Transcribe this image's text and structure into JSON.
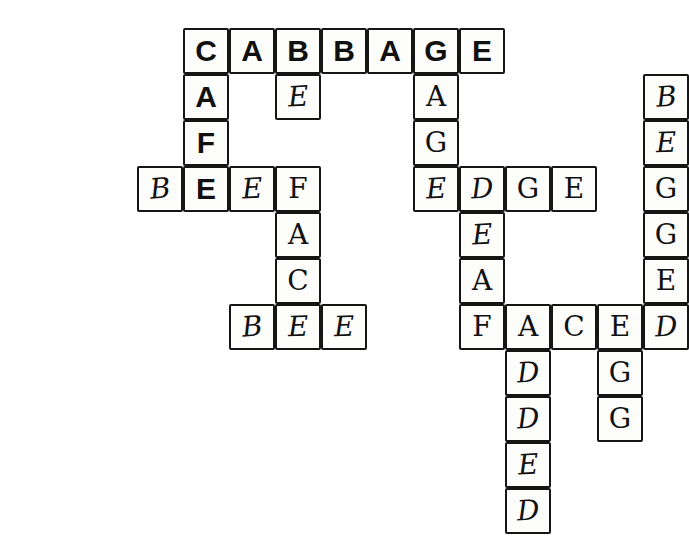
{
  "puzzle": {
    "title": "Hand-drawn crossword grid",
    "cell_size": 46,
    "origin_x": 91,
    "origin_y": 28,
    "ink_color": "#151515",
    "paper_color": "#ffffff",
    "cells": [
      {
        "r": 0,
        "c": 2,
        "letter": "C",
        "style": "printed",
        "rot": 0
      },
      {
        "r": 0,
        "c": 3,
        "letter": "A",
        "style": "printed",
        "rot": 0
      },
      {
        "r": 0,
        "c": 4,
        "letter": "B",
        "style": "printed",
        "rot": 0
      },
      {
        "r": 0,
        "c": 5,
        "letter": "B",
        "style": "printed",
        "rot": 0
      },
      {
        "r": 0,
        "c": 6,
        "letter": "A",
        "style": "printed",
        "rot": 0
      },
      {
        "r": 0,
        "c": 7,
        "letter": "G",
        "style": "printed",
        "rot": 0
      },
      {
        "r": 0,
        "c": 8,
        "letter": "E",
        "style": "printed",
        "rot": 0
      },
      {
        "r": 1,
        "c": 2,
        "letter": "A",
        "style": "printed",
        "rot": 0
      },
      {
        "r": 1,
        "c": 4,
        "letter": "E",
        "style": "hand",
        "rot": -3
      },
      {
        "r": 1,
        "c": 7,
        "letter": "A",
        "style": "hand-up",
        "rot": 0
      },
      {
        "r": 1,
        "c": 12,
        "letter": "B",
        "style": "hand",
        "rot": -4
      },
      {
        "r": 2,
        "c": 2,
        "letter": "F",
        "style": "printed",
        "rot": 0
      },
      {
        "r": 2,
        "c": 7,
        "letter": "G",
        "style": "hand-up",
        "rot": 0
      },
      {
        "r": 2,
        "c": 12,
        "letter": "E",
        "style": "hand",
        "rot": -2
      },
      {
        "r": 3,
        "c": 1,
        "letter": "B",
        "style": "hand",
        "rot": -5
      },
      {
        "r": 3,
        "c": 2,
        "letter": "E",
        "style": "printed",
        "rot": 0
      },
      {
        "r": 3,
        "c": 3,
        "letter": "E",
        "style": "hand",
        "rot": -3
      },
      {
        "r": 3,
        "c": 4,
        "letter": "F",
        "style": "hand-up",
        "rot": 0
      },
      {
        "r": 3,
        "c": 7,
        "letter": "E",
        "style": "hand",
        "rot": -3
      },
      {
        "r": 3,
        "c": 8,
        "letter": "D",
        "style": "hand",
        "rot": -3
      },
      {
        "r": 3,
        "c": 9,
        "letter": "G",
        "style": "hand-up",
        "rot": 0
      },
      {
        "r": 3,
        "c": 10,
        "letter": "E",
        "style": "hand-up",
        "rot": 0
      },
      {
        "r": 3,
        "c": 12,
        "letter": "G",
        "style": "hand-up",
        "rot": 0
      },
      {
        "r": 4,
        "c": 4,
        "letter": "A",
        "style": "hand-up",
        "rot": 0
      },
      {
        "r": 4,
        "c": 8,
        "letter": "E",
        "style": "hand",
        "rot": -3
      },
      {
        "r": 4,
        "c": 12,
        "letter": "G",
        "style": "hand-up",
        "rot": 0
      },
      {
        "r": 5,
        "c": 4,
        "letter": "C",
        "style": "hand-up",
        "rot": 0
      },
      {
        "r": 5,
        "c": 8,
        "letter": "A",
        "style": "hand-up",
        "rot": 0
      },
      {
        "r": 5,
        "c": 12,
        "letter": "E",
        "style": "hand-up",
        "rot": 0
      },
      {
        "r": 6,
        "c": 3,
        "letter": "B",
        "style": "hand",
        "rot": -5
      },
      {
        "r": 6,
        "c": 4,
        "letter": "E",
        "style": "hand",
        "rot": -2
      },
      {
        "r": 6,
        "c": 5,
        "letter": "E",
        "style": "hand",
        "rot": -2
      },
      {
        "r": 6,
        "c": 8,
        "letter": "F",
        "style": "hand-up",
        "rot": 0
      },
      {
        "r": 6,
        "c": 9,
        "letter": "A",
        "style": "hand-up",
        "rot": 0
      },
      {
        "r": 6,
        "c": 10,
        "letter": "C",
        "style": "hand-up",
        "rot": 0
      },
      {
        "r": 6,
        "c": 11,
        "letter": "E",
        "style": "hand-up",
        "rot": 0
      },
      {
        "r": 6,
        "c": 12,
        "letter": "D",
        "style": "hand",
        "rot": -3
      },
      {
        "r": 7,
        "c": 9,
        "letter": "D",
        "style": "hand",
        "rot": -3
      },
      {
        "r": 7,
        "c": 11,
        "letter": "G",
        "style": "hand-up",
        "rot": 0
      },
      {
        "r": 8,
        "c": 9,
        "letter": "D",
        "style": "hand",
        "rot": -3
      },
      {
        "r": 8,
        "c": 11,
        "letter": "G",
        "style": "hand-up",
        "rot": 0
      },
      {
        "r": 9,
        "c": 9,
        "letter": "E",
        "style": "hand",
        "rot": -3
      },
      {
        "r": 10,
        "c": 9,
        "letter": "D",
        "style": "hand",
        "rot": -3
      }
    ],
    "words": {
      "across": [
        {
          "text": "CABBAGE",
          "row": 0,
          "col": 2,
          "length": 7
        },
        {
          "text": "BEEF",
          "row": 3,
          "col": 1,
          "length": 4
        },
        {
          "text": "EDGE",
          "row": 3,
          "col": 7,
          "length": 4
        },
        {
          "text": "BEE",
          "row": 6,
          "col": 3,
          "length": 3
        },
        {
          "text": "FACED",
          "row": 6,
          "col": 8,
          "length": 5
        }
      ],
      "down": [
        {
          "text": "CAFE",
          "row": 0,
          "col": 2,
          "length": 4
        },
        {
          "text": "GAGE",
          "row": 0,
          "col": 7,
          "length": 4
        },
        {
          "text": "FACE",
          "row": 3,
          "col": 4,
          "length": 4
        },
        {
          "text": "DEAF",
          "row": 3,
          "col": 8,
          "length": 4
        },
        {
          "text": "BEGGED",
          "row": 1,
          "col": 12,
          "length": 6
        },
        {
          "text": "ADDED",
          "row": 6,
          "col": 9,
          "length": 5
        },
        {
          "text": "EGG",
          "row": 6,
          "col": 11,
          "length": 3
        }
      ]
    }
  }
}
